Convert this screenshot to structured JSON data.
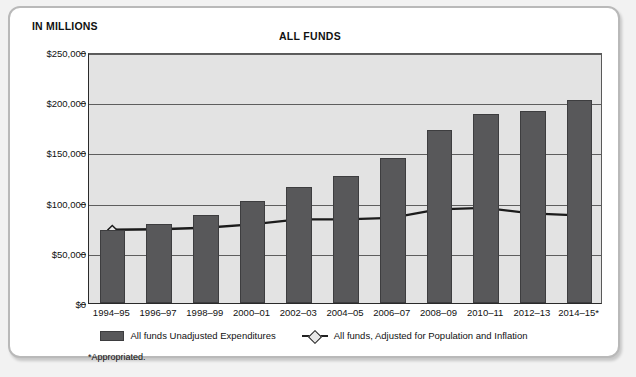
{
  "unit_label": "IN MILLIONS",
  "title": "ALL FUNDS",
  "footnote": "*Appropriated.",
  "legend": {
    "bar_label": "All funds Unadjusted Expenditures",
    "line_label": "All funds, Adjusted for Population and Inflation"
  },
  "colors": {
    "bar_fill": "#58585a",
    "plot_bg": "#e3e3e3",
    "line": "#1b1b1b",
    "marker_fill": "#e8e8e8",
    "card_border": "#b9b9b9"
  },
  "chart_data": {
    "type": "bar",
    "title": "ALL FUNDS",
    "xlabel": "",
    "ylabel": "IN MILLIONS",
    "ylim": [
      0,
      250000
    ],
    "yticks": [
      0,
      50000,
      100000,
      150000,
      200000,
      250000
    ],
    "ytick_labels": [
      "$0",
      "$50,000",
      "$100,000",
      "$150,000",
      "$200,000",
      "$250,000"
    ],
    "grid": true,
    "legend_position": "bottom",
    "categories": [
      "1994–95",
      "1996–97",
      "1998–99",
      "2000–01",
      "2002–03",
      "2004–05",
      "2006–07",
      "2008–09",
      "2010–11",
      "2012–13",
      "2014–15*"
    ],
    "series": [
      {
        "name": "All funds Unadjusted Expenditures",
        "type": "bar",
        "values": [
          73000,
          79000,
          88000,
          102000,
          116000,
          127000,
          144000,
          172000,
          188000,
          191000,
          202000
        ]
      },
      {
        "name": "All funds, Adjusted for Population and Inflation",
        "type": "line",
        "values": [
          73500,
          74000,
          75500,
          79000,
          84000,
          84000,
          85500,
          94000,
          95500,
          90000,
          88000
        ]
      }
    ]
  }
}
